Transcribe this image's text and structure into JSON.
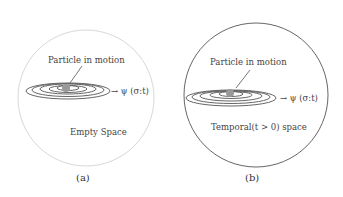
{
  "panels": [
    {
      "id": "a",
      "particle_label": "Particle in motion",
      "wave_label": "→ ψ (σ:t)",
      "space_label": "Empty Space",
      "caption": "(a)",
      "border_color": "#d8d8d8"
    },
    {
      "id": "b",
      "particle_label": "Particle in motion",
      "wave_label": "→ ψ (σ:t)",
      "space_label": "Temporal(t > 0) space",
      "caption": "(b)",
      "border_color": "#555555"
    }
  ]
}
